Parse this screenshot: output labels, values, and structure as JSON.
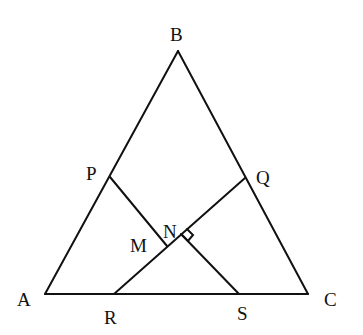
{
  "diagram": {
    "type": "geometry",
    "points": {
      "A": {
        "x": 45,
        "y": 294,
        "label": "A",
        "lx": 17,
        "ly": 306
      },
      "B": {
        "x": 178,
        "y": 51,
        "label": "B",
        "lx": 170,
        "ly": 41
      },
      "C": {
        "x": 308,
        "y": 294,
        "label": "C",
        "lx": 324,
        "ly": 306
      },
      "P": {
        "x": 110,
        "y": 177,
        "label": "P",
        "lx": 86,
        "ly": 180
      },
      "Q": {
        "x": 245,
        "y": 178,
        "label": "Q",
        "lx": 256,
        "ly": 184
      },
      "R": {
        "x": 114,
        "y": 294,
        "label": "R",
        "lx": 104,
        "ly": 324
      },
      "S": {
        "x": 239,
        "y": 294,
        "label": "S",
        "lx": 237,
        "ly": 320
      },
      "M": {
        "x": 166,
        "y": 246,
        "label": "M",
        "lx": 130,
        "ly": 252
      },
      "N": {
        "x": 181,
        "y": 234,
        "label": "N",
        "lx": 163,
        "ly": 238
      }
    },
    "segments": [
      [
        "A",
        "B"
      ],
      [
        "B",
        "C"
      ],
      [
        "A",
        "C"
      ],
      [
        "P",
        "M"
      ],
      [
        "R",
        "Q"
      ],
      [
        "N",
        "S"
      ]
    ],
    "right_angle_at": "N",
    "labels": [
      "A",
      "B",
      "C",
      "P",
      "Q",
      "R",
      "S",
      "M",
      "N"
    ]
  }
}
